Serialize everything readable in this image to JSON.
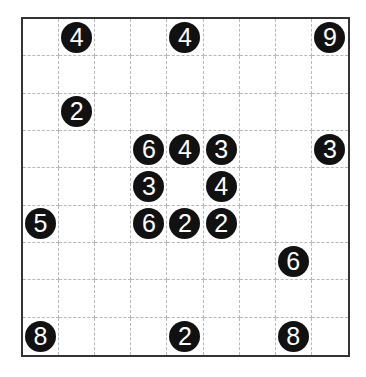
{
  "puzzle": {
    "rows": 9,
    "cols": 9,
    "colors": {
      "clue_fill": "#111111",
      "clue_text": "#ffffff",
      "border": "#333333",
      "grid_line": "#b8b8b8"
    },
    "grid": [
      [
        "",
        "4",
        "",
        "",
        "4",
        "",
        "",
        "",
        "9"
      ],
      [
        "",
        "",
        "",
        "",
        "",
        "",
        "",
        "",
        ""
      ],
      [
        "",
        "2",
        "",
        "",
        "",
        "",
        "",
        "",
        ""
      ],
      [
        "",
        "",
        "",
        "6",
        "4",
        "3",
        "",
        "",
        "3"
      ],
      [
        "",
        "",
        "",
        "3",
        "",
        "4",
        "",
        "",
        ""
      ],
      [
        "5",
        "",
        "",
        "6",
        "2",
        "2",
        "",
        "",
        ""
      ],
      [
        "",
        "",
        "",
        "",
        "",
        "",
        "",
        "6",
        ""
      ],
      [
        "",
        "",
        "",
        "",
        "",
        "",
        "",
        "",
        ""
      ],
      [
        "8",
        "",
        "",
        "",
        "2",
        "",
        "",
        "8",
        ""
      ]
    ]
  }
}
